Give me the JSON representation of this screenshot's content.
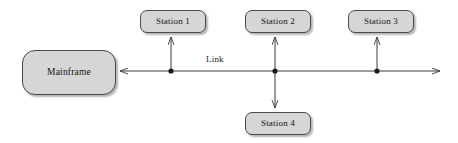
{
  "diagram": {
    "type": "bus-network-topology",
    "link_label": "Link",
    "mainframe": {
      "label": "Mainframe",
      "x": 22,
      "y": 50,
      "width": 94,
      "height": 45
    },
    "stations": [
      {
        "label": "Station 1",
        "x": 140,
        "y": 10,
        "width": 66,
        "height": 23,
        "tap_x": 171,
        "direction": "up"
      },
      {
        "label": "Station 2",
        "x": 245,
        "y": 10,
        "width": 66,
        "height": 23,
        "tap_x": 275,
        "direction": "both"
      },
      {
        "label": "Station 3",
        "x": 348,
        "y": 10,
        "width": 66,
        "height": 23,
        "tap_x": 377,
        "direction": "up"
      },
      {
        "label": "Station 4",
        "x": 245,
        "y": 112,
        "width": 66,
        "height": 23,
        "tap_x": 275,
        "direction": "down"
      }
    ],
    "bus_line": {
      "y": 71,
      "x_start": 116,
      "x_end": 444,
      "left_arrow": true,
      "right_arrow": true,
      "tap_points": [
        171,
        275,
        377
      ]
    },
    "colors": {
      "box_fill": "#d6d6d6",
      "box_border": "#4a4a4a",
      "line": "#3a3a3a",
      "text": "#141414",
      "background": "#ffffff",
      "shadow": "#5a5a5a"
    }
  }
}
